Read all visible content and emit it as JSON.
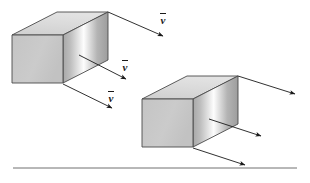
{
  "figure": {
    "background_color": "#ffffff",
    "stroke_color": "#1a1a1a",
    "arrow_color": "#1a1a1a",
    "baseline_color": "#707070",
    "face_colors": {
      "front": "#c9c9c9",
      "top": "#d6d6d6",
      "side_gradient_light": "#fdfdfd",
      "side_gradient_mid": "#b5b5b5",
      "side_gradient_dark": "#9a9a9a"
    }
  },
  "boxes": [
    {
      "id": "box-1",
      "name": "left-block",
      "front_face": {
        "x": 12,
        "y": 35,
        "width": 51,
        "height": 48
      },
      "depth_dx": 45,
      "depth_dy": -23
    },
    {
      "id": "box-2",
      "name": "right-block",
      "front_face": {
        "x": 142,
        "y": 99,
        "width": 51,
        "height": 48
      },
      "depth_dx": 45,
      "depth_dy": -23
    }
  ],
  "vectors": [
    {
      "id": "vector-1",
      "owner": "box-1",
      "label": "v",
      "has_overbar": true,
      "x1": 108,
      "y1": 12,
      "x2": 163,
      "y2": 36,
      "label_x": 160,
      "label_y": 13
    },
    {
      "id": "vector-2",
      "owner": "box-1",
      "label": "v",
      "has_overbar": true,
      "x1": 79,
      "y1": 55,
      "x2": 126,
      "y2": 79,
      "label_x": 122,
      "label_y": 60
    },
    {
      "id": "vector-3",
      "owner": "box-1",
      "label": "v",
      "has_overbar": true,
      "x1": 63,
      "y1": 84,
      "x2": 112,
      "y2": 108,
      "label_x": 108,
      "label_y": 91
    },
    {
      "id": "vector-4",
      "owner": "box-2",
      "label": "",
      "has_overbar": false,
      "x1": 238,
      "y1": 76,
      "x2": 295,
      "y2": 94,
      "label_x": 0,
      "label_y": 0
    },
    {
      "id": "vector-5",
      "owner": "box-2",
      "label": "",
      "has_overbar": false,
      "x1": 209,
      "y1": 119,
      "x2": 261,
      "y2": 136,
      "label_x": 0,
      "label_y": 0
    },
    {
      "id": "vector-6",
      "owner": "box-2",
      "label": "",
      "has_overbar": false,
      "x1": 193,
      "y1": 148,
      "x2": 245,
      "y2": 165,
      "label_x": 0,
      "label_y": 0
    }
  ],
  "baseline": {
    "name": "ground-line",
    "x1": 13,
    "y1": 168,
    "x2": 297,
    "y2": 168
  }
}
